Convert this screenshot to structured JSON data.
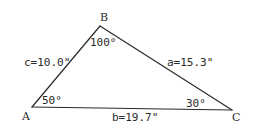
{
  "figure": {
    "type": "triangle",
    "vertices": [
      {
        "id": "A",
        "label": "A",
        "angle_label": "50°",
        "angle_deg": 50
      },
      {
        "id": "B",
        "label": "B",
        "angle_label": "100°",
        "angle_deg": 100
      },
      {
        "id": "C",
        "label": "C",
        "angle_label": "30°",
        "angle_deg": 30
      }
    ],
    "sides": [
      {
        "id": "c",
        "between": [
          "A",
          "B"
        ],
        "label": "c=10.0\"",
        "length_in": 10.0
      },
      {
        "id": "a",
        "between": [
          "B",
          "C"
        ],
        "label": "a=15.3\"",
        "length_in": 15.3
      },
      {
        "id": "b",
        "between": [
          "A",
          "C"
        ],
        "label": "b=19.7\"",
        "length_in": 19.7
      }
    ],
    "colors": {
      "ink": "#2a2a2a",
      "background": "#ffffff"
    }
  }
}
